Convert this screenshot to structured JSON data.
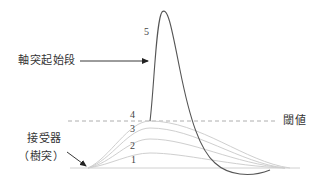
{
  "diagram": {
    "title": "",
    "labels": {
      "axon_initial_segment": "軸突起始段",
      "receptor": "接受器",
      "dendrite": "（樹突）",
      "threshold": "閾値"
    },
    "curve_numbers": [
      "1",
      "2",
      "3",
      "4",
      "5"
    ],
    "colors": {
      "action_potential_curve": "#555555",
      "subthreshold_curves": "#c8c8c8",
      "threshold_line": "#999999",
      "baseline": "#cccccc",
      "arrow": "#222222",
      "text": "#333333"
    },
    "curves": [
      {
        "id": "1",
        "type": "subthreshold",
        "peak_y": 153
      },
      {
        "id": "2",
        "type": "subthreshold",
        "peak_y": 139
      },
      {
        "id": "3",
        "type": "subthreshold",
        "peak_y": 128
      },
      {
        "id": "4",
        "type": "threshold-reaching",
        "peak_y": 121
      },
      {
        "id": "5",
        "type": "action-potential",
        "peak_y": 12
      }
    ]
  }
}
